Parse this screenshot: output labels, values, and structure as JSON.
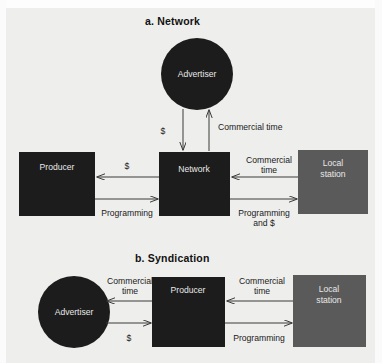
{
  "figure": {
    "background_color": "#eeeeec",
    "page_color": "#fdfdfd"
  },
  "colors": {
    "dark_node": "#1c1c1c",
    "gray_node": "#5a5a5a",
    "line": "#3a3a3a",
    "node_text": "#e8e8e8",
    "label_text": "#1a1a1a"
  },
  "panels": [
    {
      "id": "network",
      "title": "a. Network",
      "nodes": [
        {
          "id": "advertiser",
          "label": "Advertiser",
          "shape": "circle",
          "fill": "dark"
        },
        {
          "id": "producer",
          "label": "Producer",
          "shape": "rect",
          "fill": "dark"
        },
        {
          "id": "network",
          "label": "Network",
          "shape": "rect",
          "fill": "dark"
        },
        {
          "id": "local-station",
          "label_line1": "Local",
          "label_line2": "station",
          "shape": "rect",
          "fill": "gray"
        }
      ],
      "edges": [
        {
          "id": "advertiser-to-network",
          "from": "advertiser",
          "to": "network",
          "label": "$"
        },
        {
          "id": "network-to-advertiser",
          "from": "network",
          "to": "advertiser",
          "label": "Commercial time"
        },
        {
          "id": "network-to-producer",
          "from": "network",
          "to": "producer",
          "label": "$"
        },
        {
          "id": "producer-to-network",
          "from": "producer",
          "to": "network",
          "label": "Programming"
        },
        {
          "id": "localstation-to-network",
          "from": "local-station",
          "to": "network",
          "label_line1": "Commercial",
          "label_line2": "time"
        },
        {
          "id": "network-to-localstation",
          "from": "network",
          "to": "local-station",
          "label_line1": "Programming",
          "label_line2": "and $"
        }
      ]
    },
    {
      "id": "syndication",
      "title": "b. Syndication",
      "nodes": [
        {
          "id": "advertiser",
          "label": "Advertiser",
          "shape": "circle",
          "fill": "dark"
        },
        {
          "id": "producer",
          "label": "Producer",
          "shape": "rect",
          "fill": "dark"
        },
        {
          "id": "local-station",
          "label_line1": "Local",
          "label_line2": "station",
          "shape": "rect",
          "fill": "gray"
        }
      ],
      "edges": [
        {
          "id": "producer-to-advertiser",
          "from": "producer",
          "to": "advertiser",
          "label_line1": "Commercial",
          "label_line2": "time"
        },
        {
          "id": "advertiser-to-producer",
          "from": "advertiser",
          "to": "producer",
          "label": "$"
        },
        {
          "id": "localstation-to-producer",
          "from": "local-station",
          "to": "producer",
          "label_line1": "Commercial",
          "label_line2": "time"
        },
        {
          "id": "producer-to-localstation",
          "from": "producer",
          "to": "local-station",
          "label": "Programming"
        }
      ]
    }
  ]
}
